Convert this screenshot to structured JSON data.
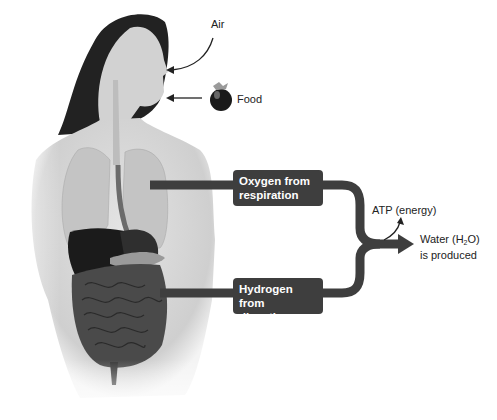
{
  "diagram": {
    "inputs": {
      "air_label": "Air",
      "food_label": "Food"
    },
    "boxes": {
      "oxygen_line1": "Oxygen from",
      "oxygen_line2": "respiration",
      "hydrogen_line1": "Hydrogen from",
      "hydrogen_line2": "digestion"
    },
    "outputs": {
      "atp_label": "ATP (energy)",
      "water_prefix": "Water (H",
      "water_sub": "2",
      "water_suffix": "O)",
      "water_line2": "is produced"
    },
    "colors": {
      "pipe": "#3e3e3e",
      "box": "#3e3e3e",
      "skin": "#d9d9d9",
      "hair": "#1f1f1f"
    }
  }
}
